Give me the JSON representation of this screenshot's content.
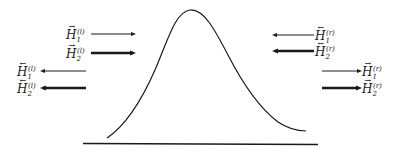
{
  "diagram": {
    "labels": {
      "left_incident_1": {
        "symbol": "H",
        "vec": "→",
        "sub": "1",
        "sup": "(l)"
      },
      "left_incident_2": {
        "symbol": "H",
        "vec": "→",
        "sub": "2",
        "sup": "(l)"
      },
      "left_reflected_1": {
        "symbol": "H",
        "vec": "←",
        "sub": "1",
        "sup": "(l)"
      },
      "left_reflected_2": {
        "symbol": "H",
        "vec": "←",
        "sub": "2",
        "sup": "(l)"
      },
      "right_incident_1": {
        "symbol": "H",
        "vec": "←",
        "sub": "1",
        "sup": "(r)"
      },
      "right_incident_2": {
        "symbol": "H",
        "vec": "←",
        "sub": "2",
        "sup": "(r)"
      },
      "right_transmitted_1": {
        "symbol": "H",
        "vec": "→",
        "sub": "1",
        "sup": "(r)"
      },
      "right_transmitted_2": {
        "symbol": "H",
        "vec": "→",
        "sub": "2",
        "sup": "(r)"
      }
    },
    "colors": {
      "ink": "#1a1a1a",
      "background": "#ffffff"
    }
  }
}
